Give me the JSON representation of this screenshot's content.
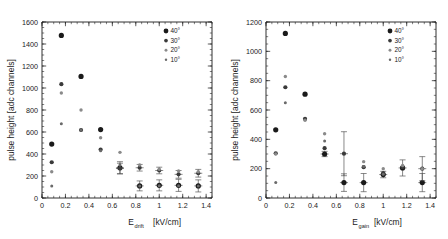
{
  "figure": {
    "title": "",
    "panel_count": 2
  },
  "legend": {
    "entries": [
      {
        "label": "40°",
        "marker": "filled-circle-large",
        "color": "#1a1a1a",
        "size": 3.0
      },
      {
        "label": "30°",
        "marker": "filled-circle-medium",
        "color": "#3a3a3a",
        "size": 2.3
      },
      {
        "label": "20°",
        "marker": "filled-circle-small",
        "color": "#8a8a8a",
        "size": 1.8
      },
      {
        "label": "10°",
        "marker": "filled-circle-tiny",
        "color": "#6a6a6a",
        "size": 1.5
      }
    ],
    "position": "top-right"
  },
  "chart_data": [
    {
      "type": "scatter",
      "panel": "left",
      "title": "",
      "xlabel": "E",
      "xlabel_sub": "drift",
      "xlabel_unit": "[kV/cm]",
      "ylabel": "pulse height [adc channels]",
      "xlim": [
        0,
        1.45
      ],
      "ylim": [
        0,
        1600
      ],
      "xticks": [
        0,
        0.2,
        0.4,
        0.6,
        0.8,
        1,
        1.2,
        1.4
      ],
      "xticklabels": [
        "0",
        "0.2",
        "0.4",
        "0.6",
        "0.8",
        "1",
        "1.2",
        "1.4"
      ],
      "yticks": [
        0,
        200,
        400,
        600,
        800,
        1000,
        1200,
        1400,
        1600
      ],
      "yticklabels": [
        "0",
        "200",
        "400",
        "600",
        "800",
        "1000",
        "1200",
        "1400",
        "1600"
      ],
      "xminor_step": 0.05,
      "yminor_step": 50,
      "grid": false,
      "series": [
        {
          "name": "40°",
          "color": "#1a1a1a",
          "size": 2.6,
          "points": [
            {
              "x": 0.083,
              "y": 490,
              "yerr": 0
            },
            {
              "x": 0.165,
              "y": 1478,
              "yerr": 0
            },
            {
              "x": 0.333,
              "y": 1105,
              "yerr": 0
            },
            {
              "x": 0.5,
              "y": 622,
              "yerr": 0
            },
            {
              "x": 0.665,
              "y": 275,
              "yerr": 55
            },
            {
              "x": 0.833,
              "y": 110,
              "yerr": 45
            },
            {
              "x": 1.0,
              "y": 115,
              "yerr": 50
            },
            {
              "x": 1.165,
              "y": 115,
              "yerr": 55
            },
            {
              "x": 1.333,
              "y": 110,
              "yerr": 55
            }
          ]
        },
        {
          "name": "30°",
          "color": "#3a3a3a",
          "size": 2.1,
          "points": [
            {
              "x": 0.083,
              "y": 325,
              "yerr": 0
            },
            {
              "x": 0.165,
              "y": 1035,
              "yerr": 0
            },
            {
              "x": 0.333,
              "y": 618,
              "yerr": 0
            },
            {
              "x": 0.5,
              "y": 440,
              "yerr": 0
            },
            {
              "x": 0.665,
              "y": 268,
              "yerr": 48
            },
            {
              "x": 0.833,
              "y": 275,
              "yerr": 30
            },
            {
              "x": 1.0,
              "y": 250,
              "yerr": 30
            },
            {
              "x": 1.165,
              "y": 215,
              "yerr": 35
            },
            {
              "x": 1.333,
              "y": 225,
              "yerr": 35
            }
          ]
        },
        {
          "name": "20°",
          "color": "#8a8a8a",
          "size": 1.7,
          "points": [
            {
              "x": 0.083,
              "y": 238,
              "yerr": 0
            },
            {
              "x": 0.165,
              "y": 955,
              "yerr": 0
            },
            {
              "x": 0.333,
              "y": 800,
              "yerr": 0
            },
            {
              "x": 0.5,
              "y": 548,
              "yerr": 0
            },
            {
              "x": 0.665,
              "y": 415,
              "yerr": 0
            },
            {
              "x": 0.833,
              "y": 300,
              "yerr": 0
            },
            {
              "x": 1.0,
              "y": 262,
              "yerr": 0
            },
            {
              "x": 1.165,
              "y": 245,
              "yerr": 0
            },
            {
              "x": 1.333,
              "y": 238,
              "yerr": 0
            }
          ]
        },
        {
          "name": "10°",
          "color": "#6a6a6a",
          "size": 1.5,
          "points": [
            {
              "x": 0.083,
              "y": 108,
              "yerr": 0
            },
            {
              "x": 0.165,
              "y": 675,
              "yerr": 0
            },
            {
              "x": 0.333,
              "y": 618,
              "yerr": 0
            },
            {
              "x": 0.5,
              "y": 430,
              "yerr": 0
            },
            {
              "x": 0.665,
              "y": 300,
              "yerr": 0
            },
            {
              "x": 0.833,
              "y": 108,
              "yerr": 0
            },
            {
              "x": 1.0,
              "y": 112,
              "yerr": 0
            },
            {
              "x": 1.165,
              "y": 112,
              "yerr": 0
            },
            {
              "x": 1.333,
              "y": 110,
              "yerr": 0
            }
          ]
        }
      ]
    },
    {
      "type": "scatter",
      "panel": "right",
      "title": "",
      "xlabel": "E",
      "xlabel_sub": "gain",
      "xlabel_unit": "[kV/cm]",
      "ylabel": "pulse height [adc channels]",
      "xlim": [
        0,
        1.45
      ],
      "ylim": [
        0,
        1200
      ],
      "xticks": [
        0,
        0.2,
        0.4,
        0.6,
        0.8,
        1,
        1.2,
        1.4
      ],
      "xticklabels": [
        "0",
        "0.2",
        "0.4",
        "0.6",
        "0.8",
        "1",
        "1.2",
        "1.4"
      ],
      "yticks": [
        0,
        200,
        400,
        600,
        800,
        1000,
        1200
      ],
      "yticklabels": [
        "0",
        "200",
        "400",
        "600",
        "800",
        "1000",
        "1200"
      ],
      "xminor_step": 0.05,
      "yminor_step": 50,
      "grid": false,
      "series": [
        {
          "name": "40°",
          "color": "#1a1a1a",
          "size": 2.6,
          "points": [
            {
              "x": 0.083,
              "y": 465,
              "yerr": 0
            },
            {
              "x": 0.165,
              "y": 1122,
              "yerr": 0
            },
            {
              "x": 0.333,
              "y": 708,
              "yerr": 0
            },
            {
              "x": 0.5,
              "y": 300,
              "yerr": 18
            },
            {
              "x": 0.665,
              "y": 105,
              "yerr": 60
            },
            {
              "x": 0.833,
              "y": 105,
              "yerr": 62
            },
            {
              "x": 1.0,
              "y": 160,
              "yerr": 22
            },
            {
              "x": 1.165,
              "y": 205,
              "yerr": 55
            },
            {
              "x": 1.333,
              "y": 105,
              "yerr": 62
            }
          ]
        },
        {
          "name": "30°",
          "color": "#3a3a3a",
          "size": 2.1,
          "points": [
            {
              "x": 0.083,
              "y": 305,
              "yerr": 0
            },
            {
              "x": 0.165,
              "y": 755,
              "yerr": 0
            },
            {
              "x": 0.333,
              "y": 540,
              "yerr": 0
            },
            {
              "x": 0.5,
              "y": 340,
              "yerr": 0
            },
            {
              "x": 0.665,
              "y": 302,
              "yerr": 150
            },
            {
              "x": 0.833,
              "y": 210,
              "yerr": 0
            },
            {
              "x": 1.0,
              "y": 170,
              "yerr": 0
            },
            {
              "x": 1.165,
              "y": 210,
              "yerr": 0
            },
            {
              "x": 1.333,
              "y": 200,
              "yerr": 82
            }
          ]
        },
        {
          "name": "20°",
          "color": "#8a8a8a",
          "size": 1.7,
          "points": [
            {
              "x": 0.083,
              "y": 300,
              "yerr": 0
            },
            {
              "x": 0.165,
              "y": 828,
              "yerr": 0
            },
            {
              "x": 0.333,
              "y": 530,
              "yerr": 0
            },
            {
              "x": 0.5,
              "y": 438,
              "yerr": 0
            },
            {
              "x": 0.833,
              "y": 248,
              "yerr": 0
            },
            {
              "x": 1.0,
              "y": 200,
              "yerr": 0
            },
            {
              "x": 1.165,
              "y": 222,
              "yerr": 0
            },
            {
              "x": 1.333,
              "y": 200,
              "yerr": 0
            }
          ]
        },
        {
          "name": "10°",
          "color": "#6a6a6a",
          "size": 1.5,
          "points": [
            {
              "x": 0.083,
              "y": 105,
              "yerr": 0
            },
            {
              "x": 0.165,
              "y": 650,
              "yerr": 0
            },
            {
              "x": 0.5,
              "y": 388,
              "yerr": 0
            },
            {
              "x": 0.833,
              "y": 215,
              "yerr": 0
            },
            {
              "x": 1.0,
              "y": 162,
              "yerr": 0
            }
          ]
        }
      ]
    }
  ]
}
